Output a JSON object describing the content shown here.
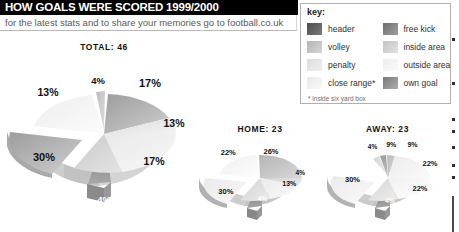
{
  "header": {
    "title": "HOW GOALS WERE SCORED 1999/2000",
    "subtitle": "for the latest stats and to share your memories go to football.co.uk"
  },
  "legend": {
    "title": "key:",
    "footnote": "* inside six yard box",
    "items": [
      {
        "label": "header",
        "color": "#4a4a4a",
        "color2": "#7d7d7d"
      },
      {
        "label": "volley",
        "color": "#b4b4b4",
        "color2": "#d6d6d6"
      },
      {
        "label": "penalty",
        "color": "#dcdcdc",
        "color2": "#f0f0f0"
      },
      {
        "label": "close range*",
        "color": "#e8e8e8",
        "color2": "#fafafa"
      },
      {
        "label": "free kick",
        "color": "#6d6d6d",
        "color2": "#a0a0a0"
      },
      {
        "label": "inside area",
        "color": "#c4c4c4",
        "color2": "#e2e2e2"
      },
      {
        "label": "outside area",
        "color": "#ececec",
        "color2": "#fbfbfb"
      },
      {
        "label": "own goal",
        "color": "#787878",
        "color2": "#aeaeae"
      }
    ]
  },
  "chart_data": [
    {
      "type": "pie",
      "title": "TOTAL: 46",
      "total": 46,
      "categories": [
        "header",
        "volley",
        "penalty",
        "close range",
        "free kick",
        "inside area",
        "outside area",
        "own goal"
      ],
      "labels": [
        "17%",
        "13%",
        "17%",
        "4%",
        "30%",
        "13%",
        "4%"
      ],
      "values": [
        17,
        13,
        17,
        4,
        30,
        13,
        4
      ],
      "legend_position": "top-right",
      "grid": false
    },
    {
      "type": "pie",
      "title": "HOME: 23",
      "total": 23,
      "labels": [
        "26%",
        "4%",
        "13%",
        "4%",
        "30%",
        "22%"
      ],
      "values": [
        26,
        4,
        13,
        4,
        30,
        22
      ],
      "grid": false
    },
    {
      "type": "pie",
      "title": "AWAY: 23",
      "total": 23,
      "labels": [
        "9%",
        "22%",
        "22%",
        "4%",
        "30%",
        "4%",
        "9%"
      ],
      "values": [
        9,
        22,
        22,
        4,
        30,
        4,
        9
      ],
      "grid": false
    }
  ],
  "charts": {
    "total": {
      "title": "TOTAL: 46",
      "pcts": [
        {
          "text": "4%",
          "x": 47,
          "y": 21,
          "size": 9.5,
          "dark": false
        },
        {
          "text": "17%",
          "x": 73,
          "y": 23,
          "size": 11,
          "dark": false
        },
        {
          "text": "13%",
          "x": 85,
          "y": 45,
          "size": 10.5,
          "dark": false
        },
        {
          "text": "17%",
          "x": 75,
          "y": 66,
          "size": 10.5,
          "dark": false
        },
        {
          "text": "4%",
          "x": 50,
          "y": 87,
          "size": 9.5,
          "dark": true
        },
        {
          "text": "30%",
          "x": 20,
          "y": 64,
          "size": 11,
          "dark": false
        },
        {
          "text": "13%",
          "x": 22,
          "y": 28,
          "size": 10.5,
          "dark": false
        }
      ]
    },
    "home": {
      "title": "HOME: 23",
      "pcts": [
        {
          "text": "26%",
          "x": 59,
          "y": 25,
          "size": 7.5,
          "dark": false
        },
        {
          "text": "4%",
          "x": 83,
          "y": 45,
          "size": 6.5,
          "dark": false
        },
        {
          "text": "13%",
          "x": 74,
          "y": 56,
          "size": 7,
          "dark": false
        },
        {
          "text": "4%",
          "x": 52,
          "y": 70,
          "size": 6.5,
          "dark": true
        },
        {
          "text": "30%",
          "x": 22,
          "y": 63,
          "size": 7.5,
          "dark": false
        },
        {
          "text": "22%",
          "x": 24,
          "y": 26,
          "size": 7.5,
          "dark": false
        }
      ]
    },
    "away": {
      "title": "AWAY: 23",
      "pcts": [
        {
          "text": "9%",
          "x": 53,
          "y": 19,
          "size": 7,
          "dark": false
        },
        {
          "text": "9%",
          "x": 70,
          "y": 19,
          "size": 7,
          "dark": false
        },
        {
          "text": "22%",
          "x": 84,
          "y": 37,
          "size": 7.5,
          "dark": false
        },
        {
          "text": "22%",
          "x": 76,
          "y": 60,
          "size": 7.5,
          "dark": false
        },
        {
          "text": "4%",
          "x": 52,
          "y": 72,
          "size": 6.5,
          "dark": true
        },
        {
          "text": "30%",
          "x": 22,
          "y": 52,
          "size": 7.5,
          "dark": false
        },
        {
          "text": "4%",
          "x": 38,
          "y": 21,
          "size": 6.5,
          "dark": false
        }
      ]
    }
  }
}
